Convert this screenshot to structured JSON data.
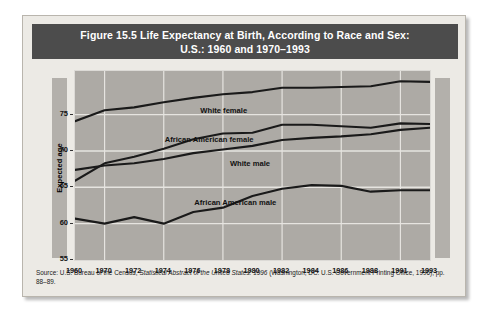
{
  "figure": {
    "title_line1": "Figure 15.5  Life Expectancy at Birth, According to Race and Sex:",
    "title_line2": "U.S.: 1960 and 1970–1993",
    "source_prefix": "Source: U.S. Bureau of the Census, ",
    "source_italic": "Statistical Abstract of the United States: 1996",
    "source_suffix": " (Washington, DC: U.S. Government Printing Office, 1996), pp. 88–89.",
    "title_bar_color": "#4c4c4c",
    "card_color": "#eceae5",
    "plot_color": "#adaaa5",
    "band_color": "#b3b0ab",
    "line_color": "#1a1a1a"
  },
  "chart_data": {
    "type": "line",
    "title": "Figure 15.5  Life Expectancy at Birth, According to Race and Sex: U.S.: 1960 and 1970–1993",
    "xlabel": "",
    "ylabel": "Expected age",
    "ylim": [
      55,
      81
    ],
    "yticks": [
      55,
      60,
      65,
      70,
      75
    ],
    "grid": true,
    "legend_position": "inline-labels",
    "categories": [
      "1960",
      "1970",
      "1972",
      "1974",
      "1976",
      "1978",
      "1980",
      "1982",
      "1984",
      "1986",
      "1988",
      "1991",
      "1993"
    ],
    "series": [
      {
        "name": "White female",
        "label": "White female",
        "values": [
          74.1,
          75.6,
          76.0,
          76.7,
          77.3,
          77.8,
          78.1,
          78.7,
          78.7,
          78.8,
          78.9,
          79.6,
          79.5
        ]
      },
      {
        "name": "African American female",
        "label": "African American female",
        "values": [
          65.9,
          68.3,
          69.2,
          70.3,
          71.6,
          72.4,
          72.5,
          73.6,
          73.6,
          73.4,
          73.2,
          73.8,
          73.7
        ]
      },
      {
        "name": "White male",
        "label": "White male",
        "values": [
          67.4,
          68.0,
          68.3,
          68.9,
          69.7,
          70.2,
          70.7,
          71.5,
          71.8,
          72.0,
          72.3,
          72.9,
          73.2
        ]
      },
      {
        "name": "African American male",
        "label": "African American male",
        "values": [
          60.7,
          60.0,
          60.9,
          60.0,
          61.6,
          62.2,
          63.8,
          64.8,
          65.3,
          65.2,
          64.4,
          64.6,
          64.6
        ]
      }
    ]
  }
}
